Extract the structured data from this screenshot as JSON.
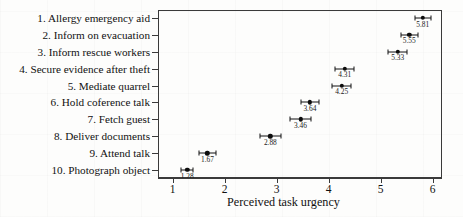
{
  "chart_data": {
    "type": "scatter",
    "title": "",
    "xlabel": "Perceived task urgency",
    "ylabel": "",
    "xlim": [
      0.72,
      6.18
    ],
    "xticks": [
      1,
      2,
      3,
      4,
      5,
      6
    ],
    "xtick_labels": [
      "1",
      "2",
      "3",
      "4",
      "5",
      "6"
    ],
    "grid": false,
    "legend": "none",
    "orientation": "horizontal",
    "marker": "filled-circle",
    "error_bars": "horizontal-with-caps",
    "categories": [
      "1. Allergy emergency aid",
      "2. Inform on evacuation",
      "3. Inform rescue workers",
      "4. Secure evidence after theft",
      "5. Mediate quarrel",
      "6. Hold coference talk",
      "7. Fetch guest",
      "8. Deliver documents",
      "9. Attend talk",
      "10. Photograph object"
    ],
    "values": [
      5.81,
      5.55,
      5.33,
      4.31,
      4.25,
      3.64,
      3.46,
      2.88,
      1.67,
      1.28
    ],
    "value_labels": [
      "5.81",
      "5.55",
      "5.33",
      "4.31",
      "4.25",
      "3.64",
      "3.46",
      "2.88",
      "1.67",
      "1.28"
    ],
    "error_low": [
      5.66,
      5.39,
      5.15,
      4.13,
      4.07,
      3.46,
      3.26,
      2.68,
      1.5,
      1.16
    ],
    "error_high": [
      5.96,
      5.71,
      5.51,
      4.49,
      4.43,
      3.82,
      3.66,
      3.08,
      1.84,
      1.4
    ],
    "series": [
      {
        "name": "Mean perceived task urgency",
        "values": [
          5.81,
          5.55,
          5.33,
          4.31,
          4.25,
          3.64,
          3.46,
          2.88,
          1.67,
          1.28
        ]
      }
    ]
  },
  "colors": {
    "marker": "#0d0d0d",
    "axis": "#3a3a3a",
    "text": "#111111",
    "background": "#fdfdfc"
  }
}
